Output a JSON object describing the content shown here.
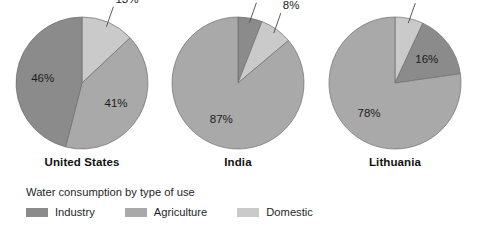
{
  "chart_data": {
    "type": "pie",
    "title": "Water consumption by type of use",
    "legend_position": "bottom-left",
    "categories": [
      "Industry",
      "Agriculture",
      "Domestic"
    ],
    "colors": {
      "Industry": "#8b8b8b",
      "Agriculture": "#a9a9a9",
      "Domestic": "#cacaca"
    },
    "charts": [
      {
        "title": "United States",
        "slices": [
          {
            "label": "Domestic",
            "value": 13,
            "display": "13%",
            "placement": "callout"
          },
          {
            "label": "Agriculture",
            "value": 41,
            "display": "41%",
            "placement": "inside"
          },
          {
            "label": "Industry",
            "value": 46,
            "display": "46%",
            "placement": "inside"
          }
        ]
      },
      {
        "title": "India",
        "slices": [
          {
            "label": "Industry",
            "value": 6,
            "display": "6%",
            "placement": "callout"
          },
          {
            "label": "Domestic",
            "value": 8,
            "display": "8%",
            "placement": "callout"
          },
          {
            "label": "Agriculture",
            "value": 87,
            "display": "87%",
            "placement": "inside"
          }
        ]
      },
      {
        "title": "Lithuania",
        "slices": [
          {
            "label": "Domestic",
            "value": 7,
            "display": "7%",
            "placement": "callout"
          },
          {
            "label": "Industry",
            "value": 16,
            "display": "16%",
            "placement": "inside"
          },
          {
            "label": "Agriculture",
            "value": 78,
            "display": "78%",
            "placement": "inside"
          }
        ]
      }
    ]
  },
  "legend": {
    "title": "Water consumption by type of use",
    "items": [
      {
        "label": "Industry",
        "color": "#8b8b8b"
      },
      {
        "label": "Agriculture",
        "color": "#a9a9a9"
      },
      {
        "label": "Domestic",
        "color": "#cacaca"
      }
    ]
  }
}
